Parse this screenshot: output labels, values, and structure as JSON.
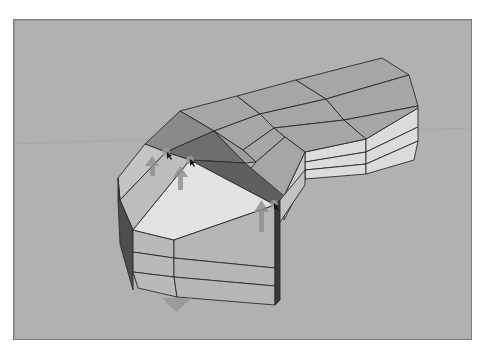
{
  "app": {
    "type": "3d-modeling-viewport",
    "view": "perspective"
  },
  "viewport": {
    "background_color": "#b1b1b1",
    "border_color": "#7d7d7d",
    "horizon_color": "#a6a6a6"
  },
  "model": {
    "description": "Segmented curved solid with lofted top faces; selected edge loop raised",
    "face_colors": {
      "top": "#a4a4a4",
      "top_selected_dark": "#6f6f6f",
      "top_selected_mid": "#8c8c8c",
      "cap_light": "#e4e4e4",
      "side_left": "#bdbdbd",
      "side_front": "#b7b7b7",
      "side_right_light": "#dcdcdc",
      "side_dark": "#4a4a4a"
    },
    "edge_color": "#2a2a2a"
  },
  "gizmos": {
    "move_arrows": [
      {
        "name": "move-arrow-up-1",
        "direction": "up",
        "color": "#8e8e8e"
      },
      {
        "name": "move-arrow-up-2",
        "direction": "up",
        "color": "#8e8e8e"
      },
      {
        "name": "move-arrow-up-3",
        "direction": "up",
        "color": "#8e8e8e"
      },
      {
        "name": "move-arrow-down",
        "direction": "down",
        "color": "#989898"
      }
    ],
    "selected_vertices": 3
  }
}
